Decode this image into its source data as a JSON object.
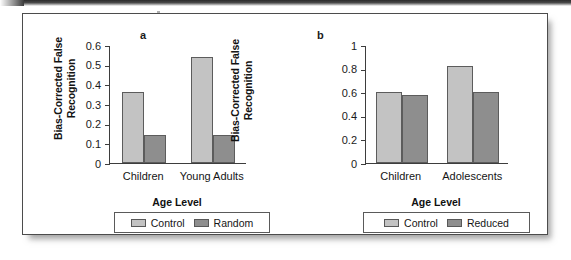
{
  "figure": {
    "panels": [
      {
        "letter": "a",
        "ylabel": "Bias-Corrected False\nRecognition",
        "xlabel": "Age Level",
        "categories": [
          "Children",
          "Young Adults"
        ],
        "yticks": [
          "0",
          "0.1",
          "0.2",
          "0.3",
          "0.4",
          "0.5",
          "0.6"
        ],
        "legend": [
          "Control",
          "Random"
        ]
      },
      {
        "letter": "b",
        "ylabel": "Bias-Corrected False\nRecognition",
        "xlabel": "Age Level",
        "categories": [
          "Children",
          "Adolescents"
        ],
        "yticks": [
          "0",
          "0.2",
          "0.4",
          "0.6",
          "0.8",
          "1"
        ],
        "legend": [
          "Control",
          "Reduced"
        ]
      }
    ]
  },
  "chart_data": [
    {
      "type": "bar",
      "panel": "a",
      "title": "",
      "xlabel": "Age Level",
      "ylabel": "Bias-Corrected False Recognition",
      "categories": [
        "Children",
        "Young Adults"
      ],
      "ylim": [
        0,
        0.6
      ],
      "ytick_values": [
        0,
        0.1,
        0.2,
        0.3,
        0.4,
        0.5,
        0.6
      ],
      "grid": false,
      "legend_position": "below-axis",
      "series": [
        {
          "name": "Control",
          "color": "#c3c3c3",
          "values": [
            0.36,
            0.54
          ]
        },
        {
          "name": "Random",
          "color": "#8e8e8e",
          "values": [
            0.14,
            0.14
          ]
        }
      ]
    },
    {
      "type": "bar",
      "panel": "b",
      "title": "",
      "xlabel": "Age Level",
      "ylabel": "Bias-Corrected False Recognition",
      "categories": [
        "Children",
        "Adolescents"
      ],
      "ylim": [
        0,
        1
      ],
      "ytick_values": [
        0,
        0.2,
        0.4,
        0.6,
        0.8,
        1
      ],
      "grid": false,
      "legend_position": "below-axis",
      "series": [
        {
          "name": "Control",
          "color": "#c3c3c3",
          "values": [
            0.6,
            0.82
          ]
        },
        {
          "name": "Reduced",
          "color": "#8e8e8e",
          "values": [
            0.58,
            0.6
          ]
        }
      ]
    }
  ]
}
